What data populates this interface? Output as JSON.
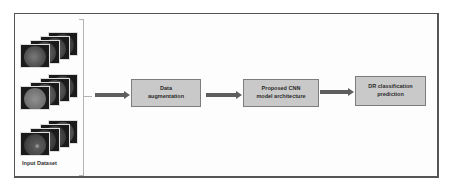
{
  "diagram": {
    "type": "pipeline-flowchart",
    "input": {
      "label": "Input Dataset",
      "image_groups": [
        {
          "name": "fundus-image-stack-1",
          "count": 4
        },
        {
          "name": "fundus-image-stack-2",
          "count": 4
        },
        {
          "name": "fundus-image-stack-3",
          "count": 4
        }
      ]
    },
    "steps": [
      {
        "id": "step1",
        "label_line1": "Data",
        "label_line2": "augmentation"
      },
      {
        "id": "step2",
        "label_line1": "Proposed CNN",
        "label_line2": "model architecture"
      },
      {
        "id": "step3",
        "label_line1": "DR classification",
        "label_line2": "prediction"
      }
    ],
    "arrows": [
      {
        "from": "input",
        "to": "step1"
      },
      {
        "from": "step1",
        "to": "step2"
      },
      {
        "from": "step2",
        "to": "step3"
      }
    ],
    "colors": {
      "box_fill": "#c9c9c9",
      "box_border": "#7d7d7d",
      "arrow": "#5e5e5e",
      "frame_border": "#555555",
      "text": "#2a2a2a"
    }
  }
}
